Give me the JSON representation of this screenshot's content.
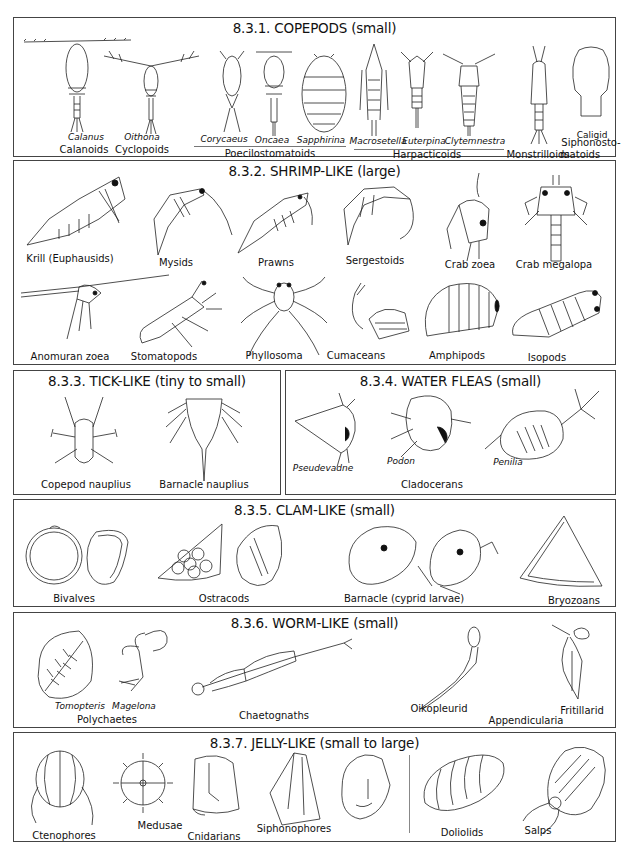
{
  "sections": {
    "copepods": {
      "title": "8.3.1. COPEPODS (small)",
      "species": [
        "Calanus",
        "Oithona",
        "Corycaeus",
        "Oncaea",
        "Sapphirina",
        "Macrosetella",
        "Euterpina",
        "Clytemnestra",
        "Caligid"
      ],
      "groups": [
        "Calanoids",
        "Cyclopoids",
        "Poecilostomatoids",
        "Harpacticoids",
        "Monstrilloids",
        "Siphonosto-",
        "matoids"
      ]
    },
    "shrimp": {
      "title": "8.3.2. SHRIMP-LIKE (large)",
      "row1": [
        "Krill (Euphausids)",
        "Mysids",
        "Prawns",
        "Sergestoids",
        "Crab zoea",
        "Crab megalopa"
      ],
      "row2": [
        "Anomuran zoea",
        "Stomatopods",
        "Phyllosoma",
        "Cumaceans",
        "Amphipods",
        "Isopods"
      ]
    },
    "tick": {
      "title": "8.3.3. TICK-LIKE (tiny to small)",
      "labels": [
        "Copepod nauplius",
        "Barnacle nauplius"
      ]
    },
    "fleas": {
      "title": "8.3.4. WATER FLEAS (small)",
      "species": [
        "Pseudevadne",
        "Podon",
        "Penilia"
      ],
      "group": "Cladocerans"
    },
    "clam": {
      "title": "8.3.5. CLAM-LIKE (small)",
      "labels": [
        "Bivalves",
        "Ostracods",
        "Barnacle (cyprid larvae)",
        "Bryozoans"
      ]
    },
    "worm": {
      "title": "8.3.6. WORM-LIKE (small)",
      "species": [
        "Tomopteris",
        "Magelona"
      ],
      "labels": [
        "Polychaetes",
        "Chaetognaths",
        "Oikopleurid",
        "Fritillarid",
        "Appendicularia"
      ]
    },
    "jelly": {
      "title": "8.3.7. JELLY-LIKE (small to large)",
      "labels": [
        "Ctenophores",
        "Medusae",
        "Cnidarians",
        "Siphonophores",
        "Doliolids",
        "Salps"
      ]
    }
  }
}
